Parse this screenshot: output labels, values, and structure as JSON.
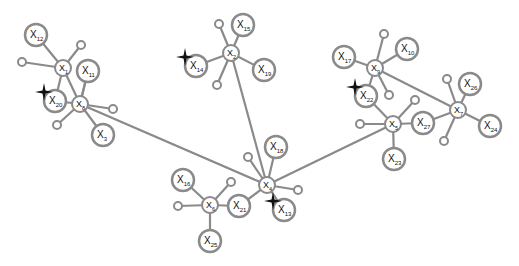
{
  "diagram": {
    "type": "graph",
    "colors": {
      "edge": "#8a8a8a",
      "node_stroke": "#8a8a8a",
      "node_fill": "#ffffff",
      "star": "#111111",
      "label": "#111111"
    },
    "hubs": [
      {
        "id": "X1",
        "sub": "1",
        "x": 63,
        "y": 68
      },
      {
        "id": "X8",
        "sub": "8",
        "x": 80,
        "y": 104
      },
      {
        "id": "X2",
        "sub": "2",
        "x": 231,
        "y": 53
      },
      {
        "id": "X9",
        "sub": "9",
        "x": 375,
        "y": 68
      },
      {
        "id": "X5",
        "sub": "5",
        "x": 393,
        "y": 124
      },
      {
        "id": "X7",
        "sub": "7",
        "x": 458,
        "y": 110
      },
      {
        "id": "X4",
        "sub": "4",
        "x": 267,
        "y": 185
      },
      {
        "id": "X6",
        "sub": "6",
        "x": 210,
        "y": 205
      }
    ],
    "leaves": [
      {
        "id": "X12",
        "sub": "12",
        "x": 36,
        "y": 35,
        "hub": "X1"
      },
      {
        "id": "X11",
        "sub": "11",
        "x": 88,
        "y": 71,
        "hub": "X8"
      },
      {
        "id": "X20",
        "sub": "20",
        "x": 55,
        "y": 101,
        "hub": "X1",
        "star": true
      },
      {
        "id": "X3",
        "sub": "3",
        "x": 103,
        "y": 135,
        "hub": "X8"
      },
      {
        "id": "X15",
        "sub": "15",
        "x": 243,
        "y": 25,
        "hub": "X2"
      },
      {
        "id": "X14",
        "sub": "14",
        "x": 196,
        "y": 66,
        "hub": "X2",
        "star": true
      },
      {
        "id": "X19",
        "sub": "19",
        "x": 264,
        "y": 70,
        "hub": "X2"
      },
      {
        "id": "X17",
        "sub": "17",
        "x": 344,
        "y": 57,
        "hub": "X9"
      },
      {
        "id": "X10",
        "sub": "10",
        "x": 407,
        "y": 49,
        "hub": "X9"
      },
      {
        "id": "X22",
        "sub": "22",
        "x": 366,
        "y": 96,
        "hub": "X5",
        "star": true
      },
      {
        "id": "X27",
        "sub": "27",
        "x": 423,
        "y": 123,
        "hub": "X5"
      },
      {
        "id": "X23",
        "sub": "23",
        "x": 394,
        "y": 159,
        "hub": "X5"
      },
      {
        "id": "X26",
        "sub": "26",
        "x": 470,
        "y": 84,
        "hub": "X7"
      },
      {
        "id": "X24",
        "sub": "24",
        "x": 490,
        "y": 126,
        "hub": "X7"
      },
      {
        "id": "X18",
        "sub": "18",
        "x": 276,
        "y": 147,
        "hub": "X4"
      },
      {
        "id": "X13",
        "sub": "13",
        "x": 284,
        "y": 210,
        "hub": "X4",
        "star": true
      },
      {
        "id": "X21",
        "sub": "21",
        "x": 239,
        "y": 206,
        "hub": "X6"
      },
      {
        "id": "X16",
        "sub": "16",
        "x": 183,
        "y": 180,
        "hub": "X6"
      },
      {
        "id": "X25",
        "sub": "25",
        "x": 210,
        "y": 241,
        "hub": "X6"
      }
    ],
    "dots": [
      {
        "x": 81,
        "y": 45,
        "hub": "X1"
      },
      {
        "x": 22,
        "y": 62,
        "hub": "X1"
      },
      {
        "x": 113,
        "y": 109,
        "hub": "X8"
      },
      {
        "x": 57,
        "y": 125,
        "hub": "X8"
      },
      {
        "x": 219,
        "y": 24,
        "hub": "X2"
      },
      {
        "x": 217,
        "y": 85,
        "hub": "X2"
      },
      {
        "x": 384,
        "y": 34,
        "hub": "X9"
      },
      {
        "x": 389,
        "y": 95,
        "hub": "X9"
      },
      {
        "x": 415,
        "y": 100,
        "hub": "X5"
      },
      {
        "x": 360,
        "y": 124,
        "hub": "X5"
      },
      {
        "x": 447,
        "y": 79,
        "hub": "X7"
      },
      {
        "x": 444,
        "y": 141,
        "hub": "X7"
      },
      {
        "x": 248,
        "y": 157,
        "hub": "X4"
      },
      {
        "x": 298,
        "y": 190,
        "hub": "X4"
      },
      {
        "x": 231,
        "y": 182,
        "hub": "X6"
      },
      {
        "x": 178,
        "y": 206,
        "hub": "X6"
      }
    ],
    "long_edges": [
      {
        "from": "X1",
        "to": "X8"
      },
      {
        "from": "X8",
        "to": "X4"
      },
      {
        "from": "X2",
        "to": "X4"
      },
      {
        "from": "X5",
        "to": "X4"
      },
      {
        "from": "X9",
        "to": "X7"
      },
      {
        "from": "X9",
        "to": "X22"
      },
      {
        "from": "X11",
        "to": "X8"
      },
      {
        "from": "X20",
        "to": "X8"
      },
      {
        "from": "X27",
        "to": "X7"
      },
      {
        "from": "X21",
        "to": "X4"
      }
    ],
    "node_prefix": "X"
  }
}
